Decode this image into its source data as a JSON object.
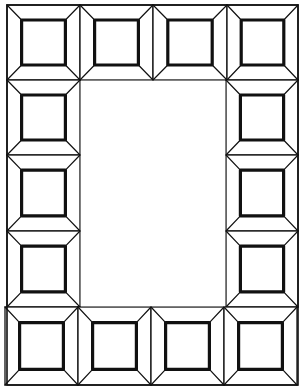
{
  "drawing": {
    "title": "Beveled square tile frame",
    "width": 305,
    "height": 391,
    "stroke_color": "#111111",
    "background": "#ffffff",
    "outer_border": {
      "x1": 7,
      "y1": 5,
      "x2": 298,
      "y2": 385
    },
    "center_opening": {
      "x1": 80,
      "y1": 80,
      "x2": 226,
      "y2": 307
    },
    "tiles": [
      {
        "row": "top",
        "x1": 7,
        "y1": 5,
        "x2": 80,
        "y2": 80
      },
      {
        "row": "top",
        "x1": 80,
        "y1": 5,
        "x2": 153,
        "y2": 80
      },
      {
        "row": "top",
        "x1": 153,
        "y1": 5,
        "x2": 227,
        "y2": 80
      },
      {
        "row": "top",
        "x1": 227,
        "y1": 5,
        "x2": 298,
        "y2": 80
      },
      {
        "row": "left",
        "x1": 7,
        "y1": 80,
        "x2": 80,
        "y2": 155
      },
      {
        "row": "left",
        "x1": 7,
        "y1": 155,
        "x2": 80,
        "y2": 231
      },
      {
        "row": "left",
        "x1": 7,
        "y1": 231,
        "x2": 80,
        "y2": 307
      },
      {
        "row": "right",
        "x1": 226,
        "y1": 80,
        "x2": 298,
        "y2": 155
      },
      {
        "row": "right",
        "x1": 226,
        "y1": 155,
        "x2": 298,
        "y2": 231
      },
      {
        "row": "right",
        "x1": 226,
        "y1": 231,
        "x2": 298,
        "y2": 307
      },
      {
        "row": "bottom",
        "x1": 5,
        "y1": 307,
        "x2": 78,
        "y2": 385
      },
      {
        "row": "bottom",
        "x1": 78,
        "y1": 307,
        "x2": 151,
        "y2": 385
      },
      {
        "row": "bottom",
        "x1": 151,
        "y1": 307,
        "x2": 224,
        "y2": 385
      },
      {
        "row": "bottom",
        "x1": 224,
        "y1": 307,
        "x2": 297,
        "y2": 385
      }
    ],
    "tile_count": 14,
    "bevel_inset_ratio": 0.2
  }
}
